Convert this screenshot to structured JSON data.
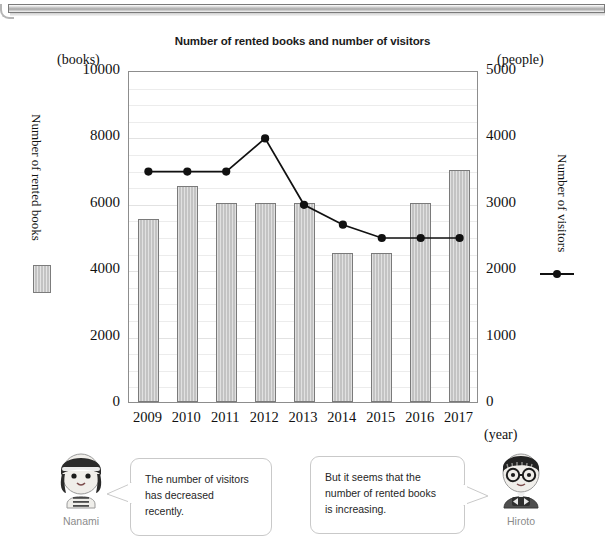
{
  "chart_data": {
    "type": "bar",
    "title": "Number of rented books and number of visitors",
    "categories": [
      "2009",
      "2010",
      "2011",
      "2012",
      "2013",
      "2014",
      "2015",
      "2016",
      "2017"
    ],
    "xlabel": "(year)",
    "grid": true,
    "left_axis": {
      "unit": "(books)",
      "title": "Number of rented books",
      "ylim": [
        0,
        10000
      ],
      "ticks": [
        "0",
        "2000",
        "4000",
        "6000",
        "8000",
        "10000"
      ],
      "tick_values": [
        0,
        2000,
        4000,
        6000,
        8000,
        10000
      ],
      "minor_step": 500
    },
    "right_axis": {
      "unit": "(people)",
      "title": "Number of visitors",
      "ylim": [
        0,
        5000
      ],
      "ticks": [
        "0",
        "1000",
        "2000",
        "3000",
        "4000",
        "5000"
      ],
      "tick_values": [
        0,
        1000,
        2000,
        3000,
        4000,
        5000
      ]
    },
    "series": [
      {
        "name": "Number of rented books",
        "type": "bar",
        "axis": "left",
        "color": "#c3c3c3",
        "edge_color": "#7a7a7a",
        "values": [
          5500,
          6500,
          6000,
          6000,
          6000,
          4500,
          4500,
          6000,
          7000
        ]
      },
      {
        "name": "Number of visitors",
        "type": "line",
        "axis": "right",
        "color": "#111111",
        "marker": "circle",
        "values": [
          3500,
          3500,
          3500,
          4000,
          3000,
          2700,
          2500,
          2500,
          2500
        ]
      }
    ]
  },
  "dialogue": {
    "left": {
      "name": "Nanami",
      "avatar": "girl-avatar",
      "lines": [
        "The number of visitors",
        "has decreased",
        "recently."
      ]
    },
    "right": {
      "name": "Hiroto",
      "avatar": "boy-with-glasses-avatar",
      "lines": [
        "But it seems that the",
        "number of rented books",
        "is increasing."
      ]
    }
  }
}
